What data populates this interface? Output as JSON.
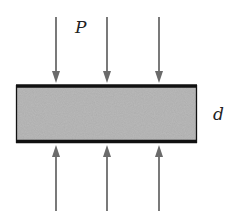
{
  "diagram": {
    "labels": {
      "pressure": "P",
      "thickness": "d"
    },
    "slab": {
      "fill_color": "#b9b9b9",
      "edge_color": "#111111"
    },
    "arrows": {
      "color": "#6b6b6b",
      "top_count": 3,
      "bottom_count": 3,
      "top_direction": "down",
      "bottom_direction": "up"
    }
  }
}
